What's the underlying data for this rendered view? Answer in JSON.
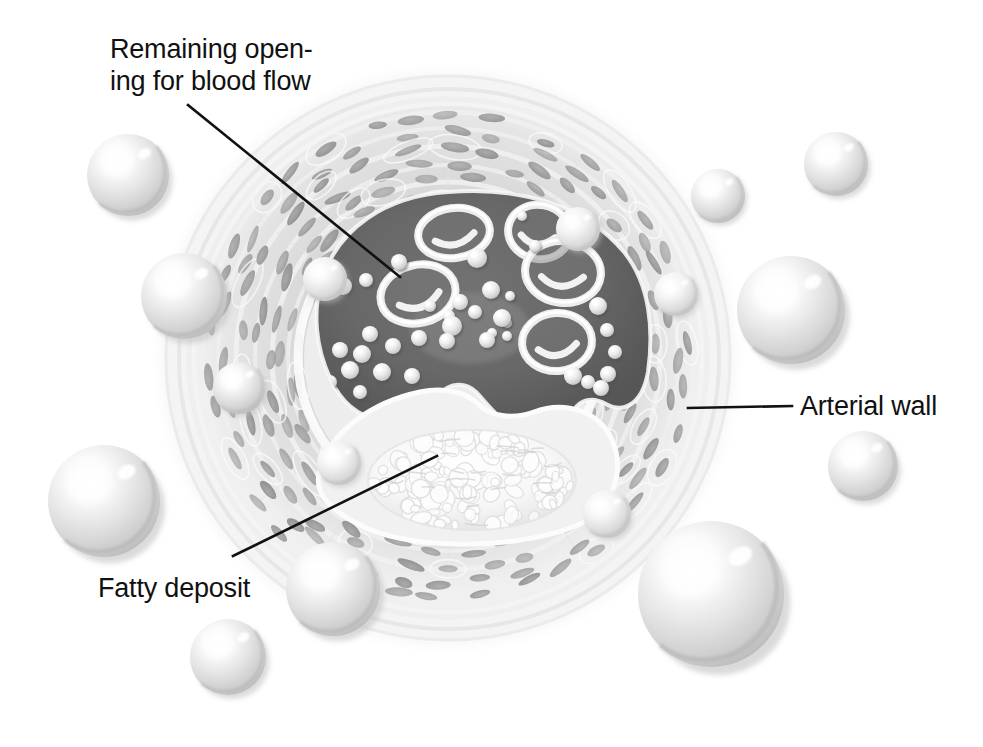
{
  "figure": {
    "background_color": "#ffffff",
    "style": "grayscale medical illustration"
  },
  "labels": [
    {
      "id": "remaining-opening",
      "line1": "Remaining open-",
      "line2": "ing for blood flow",
      "text_x": 110,
      "text_y1": 58,
      "text_y2": 90,
      "leader": {
        "x1": 188,
        "y1": 105,
        "x2": 400,
        "y2": 277
      }
    },
    {
      "id": "arterial-wall",
      "line1": "Arterial wall",
      "line2": "",
      "text_x": 800,
      "text_y1": 415,
      "text_y2": 0,
      "leader": {
        "x1": 688,
        "y1": 408,
        "x2": 792,
        "y2": 406
      }
    },
    {
      "id": "fatty-deposit",
      "line1": "Fatty deposit",
      "line2": "",
      "text_x": 98,
      "text_y1": 597,
      "text_y2": 0,
      "leader": {
        "x1": 233,
        "y1": 556,
        "x2": 437,
        "y2": 456
      }
    }
  ],
  "colors": {
    "lumen_dark": "#666666",
    "lumen_dark_edge": "#4f4f4f",
    "wall_media": "#d4d4d4",
    "wall_media_light": "#e6e6e6",
    "wall_adventitia": "#efefef",
    "wall_outer_halo": "#f6f6f6",
    "nucleus": "#9a9a9a",
    "nucleus_dark": "#8a8a8a",
    "plaque_fill": "#f2f2f2",
    "plaque_lobule": "#fbfbfb",
    "sphere_base": "#d6d6d6",
    "sphere_light": "#ffffff",
    "sphere_shadow": "#b4b4b4",
    "rbc_ring": "#eeeeee",
    "leader_line": "#111111",
    "text": "#111111"
  },
  "artery": {
    "center_x": 448,
    "center_y": 358,
    "outer_radius": 296,
    "adventitia_radius": 276,
    "media_outer_radius": 252,
    "media_inner_radius": 150,
    "intima_radius": 142,
    "ring_count": 7
  },
  "lumen": {
    "description": "Crescent / kidney shaped remaining opening for blood flow",
    "fill": "#666666"
  },
  "plaque": {
    "description": "Fatty deposit bulging into the lumen from the lower wall",
    "center_x": 470,
    "center_y": 478,
    "width": 200,
    "height": 96
  },
  "red_blood_cells": [
    {
      "cx": 418,
      "cy": 294,
      "rx": 38,
      "ry": 29,
      "rot": -14
    },
    {
      "cx": 454,
      "cy": 233,
      "rx": 36,
      "ry": 25,
      "rot": -8
    },
    {
      "cx": 539,
      "cy": 232,
      "rx": 31,
      "ry": 27,
      "rot": 10
    },
    {
      "cx": 563,
      "cy": 272,
      "rx": 38,
      "ry": 31,
      "rot": 6
    },
    {
      "cx": 557,
      "cy": 342,
      "rx": 35,
      "ry": 29,
      "rot": -4
    }
  ],
  "fat_droplets_in_lumen": [
    {
      "cx": 343,
      "cy": 286,
      "r": 9
    },
    {
      "cx": 366,
      "cy": 280,
      "r": 7
    },
    {
      "cx": 399,
      "cy": 262,
      "r": 8
    },
    {
      "cx": 477,
      "cy": 258,
      "r": 10
    },
    {
      "cx": 491,
      "cy": 290,
      "r": 9
    },
    {
      "cx": 460,
      "cy": 302,
      "r": 8
    },
    {
      "cx": 475,
      "cy": 312,
      "r": 7
    },
    {
      "cx": 430,
      "cy": 306,
      "r": 6
    },
    {
      "cx": 500,
      "cy": 316,
      "r": 5
    },
    {
      "cx": 510,
      "cy": 296,
      "r": 5
    },
    {
      "cx": 507,
      "cy": 323,
      "r": 5
    },
    {
      "cx": 492,
      "cy": 333,
      "r": 5
    },
    {
      "cx": 507,
      "cy": 336,
      "r": 5
    },
    {
      "cx": 449,
      "cy": 316,
      "r": 6
    },
    {
      "cx": 452,
      "cy": 326,
      "r": 10
    },
    {
      "cx": 502,
      "cy": 318,
      "r": 9
    },
    {
      "cx": 487,
      "cy": 340,
      "r": 8
    },
    {
      "cx": 419,
      "cy": 338,
      "r": 8
    },
    {
      "cx": 447,
      "cy": 341,
      "r": 8
    },
    {
      "cx": 393,
      "cy": 346,
      "r": 8
    },
    {
      "cx": 362,
      "cy": 354,
      "r": 9
    },
    {
      "cx": 370,
      "cy": 334,
      "r": 8
    },
    {
      "cx": 340,
      "cy": 350,
      "r": 8
    },
    {
      "cx": 350,
      "cy": 370,
      "r": 9
    },
    {
      "cx": 382,
      "cy": 372,
      "r": 9
    },
    {
      "cx": 412,
      "cy": 376,
      "r": 8
    },
    {
      "cx": 330,
      "cy": 382,
      "r": 7
    },
    {
      "cx": 360,
      "cy": 392,
      "r": 7
    },
    {
      "cx": 598,
      "cy": 306,
      "r": 9
    },
    {
      "cx": 607,
      "cy": 330,
      "r": 7
    },
    {
      "cx": 615,
      "cy": 352,
      "r": 7
    },
    {
      "cx": 608,
      "cy": 374,
      "r": 8
    },
    {
      "cx": 573,
      "cy": 376,
      "r": 9
    },
    {
      "cx": 588,
      "cy": 382,
      "r": 7
    },
    {
      "cx": 601,
      "cy": 388,
      "r": 8
    },
    {
      "cx": 535,
      "cy": 246,
      "r": 6
    },
    {
      "cx": 522,
      "cy": 216,
      "r": 5
    }
  ],
  "fat_spheres": [
    {
      "cx": 128,
      "cy": 175,
      "r": 41
    },
    {
      "cx": 184,
      "cy": 296,
      "r": 43
    },
    {
      "cx": 239,
      "cy": 388,
      "r": 26
    },
    {
      "cx": 104,
      "cy": 501,
      "r": 56
    },
    {
      "cx": 228,
      "cy": 657,
      "r": 38
    },
    {
      "cx": 333,
      "cy": 589,
      "r": 47
    },
    {
      "cx": 711,
      "cy": 594,
      "r": 73
    },
    {
      "cx": 863,
      "cy": 466,
      "r": 35
    },
    {
      "cx": 791,
      "cy": 310,
      "r": 54
    },
    {
      "cx": 836,
      "cy": 164,
      "r": 32
    },
    {
      "cx": 718,
      "cy": 196,
      "r": 27
    },
    {
      "cx": 676,
      "cy": 294,
      "r": 22
    },
    {
      "cx": 607,
      "cy": 514,
      "r": 24
    },
    {
      "cx": 339,
      "cy": 463,
      "r": 22
    },
    {
      "cx": 578,
      "cy": 229,
      "r": 22
    },
    {
      "cx": 325,
      "cy": 279,
      "r": 22
    }
  ]
}
